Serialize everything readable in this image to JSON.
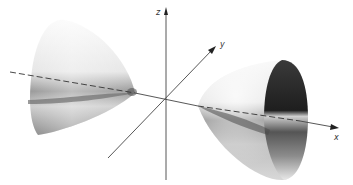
{
  "diagram": {
    "type": "hyperboloid-of-two-sheets",
    "axes": {
      "x": {
        "label": "x"
      },
      "y": {
        "label": "y"
      },
      "z": {
        "label": "z"
      }
    },
    "colors": {
      "background": "#ffffff",
      "axis": "#444444",
      "surface_dark": "#2a2a2a",
      "surface_light": "#f4f4f4"
    }
  }
}
